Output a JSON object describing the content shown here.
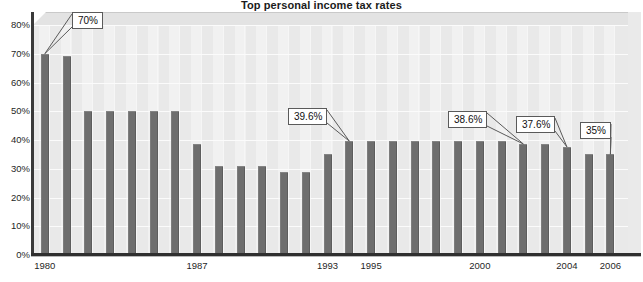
{
  "chart_data": {
    "type": "bar",
    "title": "Top personal income tax rates",
    "xlabel": "",
    "ylabel": "",
    "ylim": [
      0,
      80
    ],
    "ytick_labels": [
      "0%",
      "10%",
      "20%",
      "30%",
      "40%",
      "50%",
      "60%",
      "70%",
      "80%"
    ],
    "ytick_values": [
      0,
      10,
      20,
      30,
      40,
      50,
      60,
      70,
      80
    ],
    "grid": true,
    "legend": "none",
    "bar_color": "#6e6e6e",
    "categories": [
      "1980",
      "1981",
      "1982",
      "1983",
      "1984",
      "1985",
      "1986",
      "1987",
      "1988",
      "1989",
      "1990",
      "1991",
      "1992",
      "1993",
      "1994",
      "1995",
      "1996",
      "1997",
      "1998",
      "1999",
      "2000",
      "2001",
      "2002",
      "2003",
      "2004",
      "2005",
      "2006"
    ],
    "values": [
      70,
      69.1,
      50,
      50,
      50,
      50,
      50,
      38.5,
      31,
      31,
      31,
      28.9,
      28.9,
      35,
      39.6,
      39.6,
      39.6,
      39.6,
      39.6,
      39.6,
      39.6,
      39.6,
      38.6,
      38.6,
      37.6,
      35,
      35
    ],
    "xtick_labels": [
      "1980",
      "1987",
      "1993",
      "1995",
      "2000",
      "2004",
      "2006"
    ],
    "xtick_categories": [
      "1980",
      "1987",
      "1993",
      "1995",
      "2000",
      "2004",
      "2006"
    ],
    "annotations": [
      {
        "label": "70%",
        "value": 70,
        "category": "1980"
      },
      {
        "label": "39.6%",
        "value": 39.6,
        "category": "1994"
      },
      {
        "label": "38.6%",
        "value": 38.6,
        "category": "2002"
      },
      {
        "label": "37.6%",
        "value": 37.6,
        "category": "2004"
      },
      {
        "label": "35%",
        "value": 35,
        "category": "2006"
      }
    ]
  }
}
